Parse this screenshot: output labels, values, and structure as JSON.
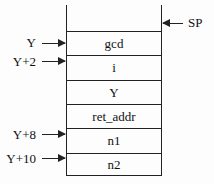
{
  "stack": {
    "cells": [
      "gcd",
      "i",
      "Y",
      "ret_addr",
      "n1",
      "n2"
    ]
  },
  "pointers": {
    "sp": "SP",
    "left": [
      {
        "label": "Y",
        "cell_index": 0
      },
      {
        "label": "Y+2",
        "cell_index": 1
      },
      {
        "label": "Y+8",
        "cell_index": 4
      },
      {
        "label": "Y+10",
        "cell_index": 5
      }
    ]
  }
}
